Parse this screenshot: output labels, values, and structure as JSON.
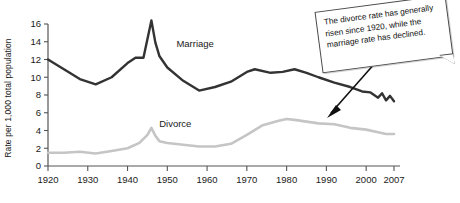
{
  "chart_data": {
    "type": "line",
    "title": "",
    "xlabel": "",
    "ylabel": "Rate per 1,000 total population",
    "xlim": [
      1920,
      2007
    ],
    "ylim": [
      0,
      16
    ],
    "grid": false,
    "legend_position": "inline-labels",
    "xticks": [
      1920,
      1930,
      1940,
      1950,
      1960,
      1970,
      1980,
      1990,
      2000,
      2007
    ],
    "xtick_labels": [
      "1920",
      "1930",
      "1940",
      "1950",
      "1960",
      "1970",
      "1980",
      "1990",
      "2000",
      "2007"
    ],
    "yticks": [
      0,
      2,
      4,
      6,
      8,
      10,
      12,
      14,
      16
    ],
    "ytick_labels": [
      "0",
      "2",
      "4",
      "6",
      "8",
      "10",
      "12",
      "14",
      "16"
    ],
    "series": [
      {
        "name": "Marriage",
        "color": "#333333",
        "label_x": 1957,
        "label_y": 13.4,
        "x": [
          1920,
          1924,
          1928,
          1932,
          1936,
          1940,
          1942,
          1944,
          1946,
          1947,
          1948,
          1950,
          1954,
          1958,
          1962,
          1966,
          1970,
          1972,
          1976,
          1979,
          1982,
          1985,
          1988,
          1992,
          1996,
          1999,
          2001,
          2002,
          2003,
          2004,
          2005,
          2006,
          2007
        ],
        "y": [
          12.0,
          10.9,
          9.8,
          9.2,
          10.0,
          11.6,
          12.2,
          12.2,
          16.4,
          13.9,
          12.4,
          11.1,
          9.6,
          8.5,
          8.9,
          9.5,
          10.6,
          10.9,
          10.5,
          10.6,
          10.9,
          10.5,
          10.0,
          9.4,
          8.9,
          8.4,
          8.3,
          8.0,
          7.7,
          8.2,
          7.4,
          7.9,
          7.3
        ]
      },
      {
        "name": "Divorce",
        "color": "#c5c5c5",
        "label_x": 1952,
        "label_y": 4.4,
        "x": [
          1920,
          1924,
          1928,
          1932,
          1936,
          1940,
          1943,
          1945,
          1946,
          1947,
          1948,
          1950,
          1954,
          1958,
          1962,
          1966,
          1970,
          1974,
          1978,
          1980,
          1982,
          1985,
          1988,
          1992,
          1996,
          2000,
          2003,
          2005,
          2007
        ],
        "y": [
          1.5,
          1.5,
          1.6,
          1.4,
          1.7,
          2.0,
          2.6,
          3.5,
          4.3,
          3.4,
          2.8,
          2.6,
          2.4,
          2.2,
          2.2,
          2.5,
          3.5,
          4.6,
          5.1,
          5.3,
          5.2,
          5.0,
          4.8,
          4.7,
          4.3,
          4.1,
          3.8,
          3.6,
          3.6
        ]
      }
    ],
    "annotation": {
      "text": "The divorce rate has generally risen since 1920, while the marriage rate has declined.",
      "arrow": true
    }
  }
}
